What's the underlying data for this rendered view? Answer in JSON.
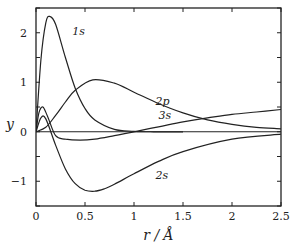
{
  "chart_data": {
    "type": "line",
    "title": "",
    "xlabel": "r / Å",
    "ylabel": "y",
    "xlim": [
      0,
      2.5
    ],
    "ylim": [
      -1.5,
      2.5
    ],
    "xticks": [
      0,
      0.5,
      1,
      1.5,
      2,
      2.5
    ],
    "xtick_labels": [
      "0",
      "0.5",
      "1",
      "1.5",
      "2",
      "2.5"
    ],
    "yticks": [
      -1,
      0,
      1,
      2
    ],
    "ytick_labels": [
      "−1",
      "0",
      "1",
      "2"
    ],
    "grid": false,
    "legend": "none (inline curve labels)",
    "zero_line": true,
    "series": [
      {
        "name": "1s",
        "label": "1s",
        "x": [
          0,
          0.05,
          0.1,
          0.14,
          0.2,
          0.3,
          0.4,
          0.5,
          0.6,
          0.8,
          1.0,
          1.2,
          1.5
        ],
        "y": [
          0,
          1.45,
          2.2,
          2.33,
          2.17,
          1.5,
          0.88,
          0.47,
          0.24,
          0.05,
          0.01,
          0,
          0
        ]
      },
      {
        "name": "2p",
        "label": "2p",
        "x": [
          0,
          0.1,
          0.2,
          0.3,
          0.4,
          0.58,
          0.8,
          1.0,
          1.25,
          1.5,
          1.75,
          2.0,
          2.25,
          2.5
        ],
        "y": [
          0,
          0.09,
          0.33,
          0.6,
          0.84,
          1.05,
          0.98,
          0.8,
          0.57,
          0.38,
          0.24,
          0.15,
          0.09,
          0.06
        ]
      },
      {
        "name": "2s",
        "label": "2s",
        "x": [
          0,
          0.05,
          0.1,
          0.2,
          0.3,
          0.4,
          0.5,
          0.6,
          0.7,
          0.8,
          1.0,
          1.25,
          1.5,
          2.0,
          2.5
        ],
        "y": [
          0,
          0.28,
          0.26,
          -0.27,
          -0.75,
          -1.05,
          -1.18,
          -1.2,
          -1.15,
          -1.06,
          -0.85,
          -0.6,
          -0.4,
          -0.15,
          -0.05
        ]
      },
      {
        "name": "3s",
        "label": "3s",
        "x": [
          0,
          0.03,
          0.07,
          0.12,
          0.2,
          0.3,
          0.45,
          0.6,
          0.8,
          1.0,
          1.25,
          1.5,
          1.75,
          2.0,
          2.25,
          2.5
        ],
        "y": [
          0,
          0.38,
          0.5,
          0.3,
          -0.08,
          -0.15,
          -0.17,
          -0.15,
          -0.08,
          0.0,
          0.1,
          0.2,
          0.28,
          0.35,
          0.4,
          0.45
        ]
      }
    ],
    "annotations": [
      {
        "text": "1s",
        "x": 0.37,
        "y": 1.95
      },
      {
        "text": "2p",
        "x": 1.22,
        "y": 0.55
      },
      {
        "text": "3s",
        "x": 1.25,
        "y": 0.25
      },
      {
        "text": "2s",
        "x": 1.22,
        "y": -0.95
      }
    ]
  }
}
